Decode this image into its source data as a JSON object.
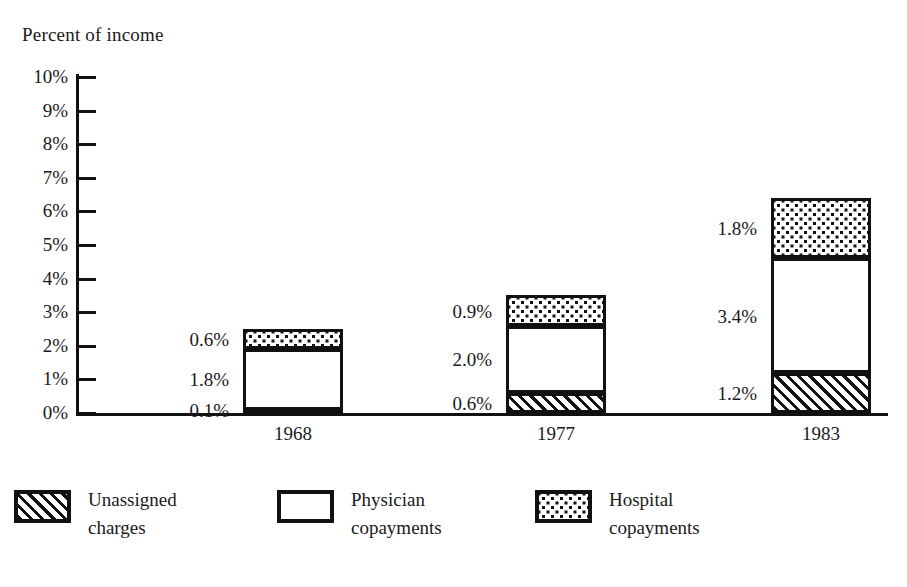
{
  "page": {
    "top_cut_text": "",
    "background_color": "#ffffff",
    "ink_color": "#111111"
  },
  "axis_title": "Percent of income",
  "y_axis": {
    "tick_labels": [
      "10%",
      "9%",
      "8%",
      "7%",
      "6%",
      "5%",
      "4%",
      "3%",
      "2%",
      "1%",
      "0%"
    ],
    "min": 0,
    "max": 10
  },
  "x_axis": {
    "categories": [
      "1968",
      "1977",
      "1983"
    ]
  },
  "legend": {
    "items": [
      {
        "name": "unassigned-charges",
        "line1": "Unassigned",
        "line2": "charges",
        "pattern": "hatch"
      },
      {
        "name": "physician-copayments",
        "line1": "Physician",
        "line2": "copayments",
        "pattern": "white"
      },
      {
        "name": "hospital-copayments",
        "line1": "Hospital",
        "line2": "copayments",
        "pattern": "dots"
      }
    ]
  },
  "bars": [
    {
      "year": "1968",
      "total": "2.5%",
      "segments": [
        {
          "series": "Unassigned charges",
          "label": "0.1%",
          "value": 0.1,
          "pattern": "hatch"
        },
        {
          "series": "Physician copayments",
          "label": "1.8%",
          "value": 1.8,
          "pattern": "white"
        },
        {
          "series": "Hospital copayments",
          "label": "0.6%",
          "value": 0.6,
          "pattern": "dots"
        }
      ]
    },
    {
      "year": "1977",
      "total": "3.5%",
      "segments": [
        {
          "series": "Unassigned charges",
          "label": "0.6%",
          "value": 0.6,
          "pattern": "hatch"
        },
        {
          "series": "Physician copayments",
          "label": "2.0%",
          "value": 2.0,
          "pattern": "white"
        },
        {
          "series": "Hospital copayments",
          "label": "0.9%",
          "value": 0.9,
          "pattern": "dots"
        }
      ]
    },
    {
      "year": "1983",
      "total": "6.4%",
      "segments": [
        {
          "series": "Unassigned charges",
          "label": "1.2%",
          "value": 1.2,
          "pattern": "hatch"
        },
        {
          "series": "Physician copayments",
          "label": "3.4%",
          "value": 3.4,
          "pattern": "white"
        },
        {
          "series": "Hospital copayments",
          "label": "1.8%",
          "value": 1.8,
          "pattern": "dots"
        }
      ]
    }
  ],
  "chart_data": {
    "type": "bar",
    "subtype": "stacked-vertical",
    "title": "",
    "xlabel": "",
    "ylabel": "Percent of income",
    "categories": [
      "1968",
      "1977",
      "1983"
    ],
    "ylim": [
      0,
      10
    ],
    "ytick_labels": [
      "0%",
      "1%",
      "2%",
      "3%",
      "4%",
      "5%",
      "6%",
      "7%",
      "8%",
      "9%",
      "10%"
    ],
    "ytick_values": [
      0,
      1,
      2,
      3,
      4,
      5,
      6,
      7,
      8,
      9,
      10
    ],
    "grid": false,
    "legend_position": "bottom",
    "stack_order_bottom_to_top": [
      "Unassigned charges",
      "Physician copayments",
      "Hospital copayments"
    ],
    "series": [
      {
        "name": "Unassigned charges",
        "pattern": "diagonal-hatch",
        "values": [
          0.1,
          0.6,
          1.2
        ],
        "labels": [
          "0.1%",
          "0.6%",
          "1.2%"
        ]
      },
      {
        "name": "Physician copayments",
        "pattern": "white-fill",
        "values": [
          1.8,
          2.0,
          3.4
        ],
        "labels": [
          "1.8%",
          "2.0%",
          "3.4%"
        ]
      },
      {
        "name": "Hospital copayments",
        "pattern": "dot-screen",
        "values": [
          0.6,
          0.9,
          1.8
        ],
        "labels": [
          "0.6%",
          "0.9%",
          "1.8%"
        ]
      }
    ],
    "totals": [
      2.5,
      3.5,
      6.4
    ]
  }
}
